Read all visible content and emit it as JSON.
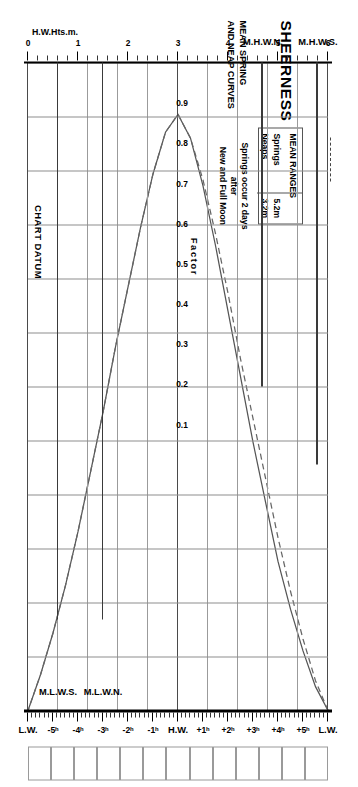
{
  "header": {
    "title": "SHEERNESS",
    "subtitle_line1": "MEAN SPRING",
    "subtitle_line2": "AND NEAP CURVES"
  },
  "legend": {
    "heading": "MEAN RANGES",
    "rows": [
      {
        "label": "Springs",
        "value": "5.2m",
        "style": "solid"
      },
      {
        "label": "Neaps",
        "value": "3.2m",
        "style": "dashed"
      }
    ]
  },
  "note": {
    "line1": "Springs occur 2 days",
    "line2": "after",
    "line3": "New and Full Moon"
  },
  "axes": {
    "left_axis_label": "H.W.Hts.m.",
    "left_ticks": [
      "0",
      "1",
      "2",
      "3",
      "4",
      "5",
      "6"
    ],
    "right_axis_label": "L.W.Hts.m.",
    "right_ticks": [
      "0",
      "1",
      "2",
      "3"
    ],
    "time_labels": [
      "H.W.",
      "+1ʰ",
      "+2ʰ",
      "+3ʰ",
      "+4ʰ",
      "+5ʰ",
      "L.W."
    ],
    "time_labels_before": [
      "-1ʰ",
      "-2ʰ",
      "-3ʰ",
      "-4ʰ",
      "-5ʰ",
      "L.W."
    ],
    "factor_title": "Factor",
    "factor_ticks": [
      "0.9",
      "0.8",
      "0.7",
      "0.6",
      "0.5",
      "0.4",
      "0.3",
      "0.2",
      "0.1"
    ]
  },
  "markers": {
    "mhws": "M.H.W.S.",
    "mhwn": "M.H.W.N.",
    "mlwn": "M.L.W.N.",
    "mlws": "M.L.W.S.",
    "chart_datum": "CHART DATUM",
    "hw": "H.W.",
    "lw": "L.W."
  },
  "chart_data": {
    "type": "line",
    "xlabel": "Hours relative to High Water",
    "ylabel": "Factor",
    "xlim": [
      -6,
      6
    ],
    "ylim": [
      0,
      1
    ],
    "grid": true,
    "legend_position": "top-left",
    "x": [
      -6,
      -5.5,
      -5,
      -4.5,
      -4,
      -3.5,
      -3,
      -2.5,
      -2,
      -1.5,
      -1,
      -0.5,
      0,
      0.5,
      1,
      1.5,
      2,
      2.5,
      3,
      3.5,
      4,
      4.5,
      5,
      5.5,
      6
    ],
    "series": [
      {
        "name": "Springs",
        "style": "solid",
        "mean_range_m": 5.2,
        "values": [
          0.0,
          0.04,
          0.1,
          0.17,
          0.25,
          0.35,
          0.45,
          0.56,
          0.67,
          0.78,
          0.88,
          0.96,
          1.0,
          0.97,
          0.9,
          0.81,
          0.71,
          0.61,
          0.5,
          0.4,
          0.3,
          0.21,
          0.13,
          0.06,
          0.0
        ]
      },
      {
        "name": "Neaps",
        "style": "dashed",
        "mean_range_m": 3.2,
        "values": [
          0.0,
          0.05,
          0.12,
          0.2,
          0.29,
          0.39,
          0.49,
          0.59,
          0.7,
          0.8,
          0.89,
          0.96,
          1.0,
          0.97,
          0.9,
          0.81,
          0.71,
          0.61,
          0.5,
          0.4,
          0.3,
          0.21,
          0.13,
          0.06,
          0.0
        ]
      }
    ],
    "reference_levels": [
      {
        "name": "M.H.W.S.",
        "value_m": 5.8,
        "scale": "H.W.Hts.m."
      },
      {
        "name": "M.H.W.N.",
        "value_m": 4.7,
        "scale": "H.W.Hts.m."
      },
      {
        "name": "M.L.W.N.",
        "value_m": 1.5,
        "scale": "L.W.Hts.m."
      },
      {
        "name": "M.L.W.S.",
        "value_m": 0.6,
        "scale": "L.W.Hts.m."
      },
      {
        "name": "CHART DATUM",
        "value_m": 0.0,
        "scale": "both"
      }
    ]
  }
}
